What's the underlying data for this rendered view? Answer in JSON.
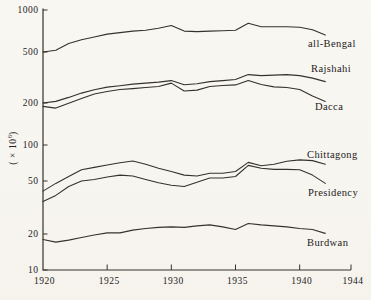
{
  "page": {
    "background": "#f8f6f1",
    "ink": "#35322c",
    "text_color": "#24211c"
  },
  "y_axis_title": {
    "base": "( × 10",
    "exponent": "6",
    "close": ")"
  },
  "chart_data": {
    "type": "line",
    "title": "",
    "xlabel": "",
    "ylabel": "( × 10⁶)",
    "y_scale": "log",
    "grid": false,
    "legend_position": "inline-right",
    "ylim": [
      10,
      1000
    ],
    "xlim": [
      1920,
      1944
    ],
    "y_ticks": [
      1000,
      500,
      200,
      100,
      50,
      20,
      10
    ],
    "x_ticks": [
      1920,
      1925,
      1930,
      1935,
      1940,
      1944
    ],
    "x": [
      1920,
      1921,
      1922,
      1923,
      1924,
      1925,
      1926,
      1927,
      1928,
      1929,
      1930,
      1931,
      1932,
      1933,
      1934,
      1935,
      1936,
      1937,
      1938,
      1939,
      1940,
      1941,
      1942
    ],
    "series": [
      {
        "name": "all-Bengal",
        "values": [
          500,
          515,
          575,
          613,
          640,
          672,
          689,
          706,
          717,
          741,
          774,
          706,
          700,
          706,
          711,
          717,
          803,
          758,
          758,
          758,
          752,
          723,
          661
        ],
        "label_pos": [
          308,
          47
        ]
      },
      {
        "name": "Rajshahi",
        "values": [
          200,
          206,
          221,
          239,
          254,
          266,
          273,
          281,
          286,
          291,
          299,
          278,
          283,
          294,
          299,
          305,
          333,
          327,
          330,
          333,
          327,
          313,
          294
        ],
        "label_pos": [
          311,
          72
        ]
      },
      {
        "name": "Dacca",
        "values": [
          189,
          184,
          199,
          217,
          235,
          246,
          255,
          259,
          264,
          269,
          286,
          248,
          252,
          269,
          274,
          277,
          300,
          279,
          267,
          264,
          255,
          227,
          206
        ],
        "label_pos": [
          315,
          110
        ]
      },
      {
        "name": "Chittagong",
        "values": [
          42,
          48,
          54.5,
          62,
          65,
          68,
          71,
          73.5,
          69,
          64,
          60,
          56,
          55,
          58,
          58,
          60,
          71.5,
          67,
          69,
          73,
          75,
          74,
          69
        ],
        "label_pos": [
          307,
          158
        ]
      },
      {
        "name": "Presidency",
        "values": [
          35,
          39,
          45.5,
          50,
          51.5,
          54,
          56,
          55,
          51.5,
          48.5,
          46.5,
          45.5,
          49,
          53,
          53,
          54.5,
          67.5,
          64,
          62.5,
          62.5,
          62,
          56,
          48
        ],
        "label_pos": [
          308,
          196
        ]
      },
      {
        "name": "Burdwan",
        "values": [
          18,
          17.1,
          17.8,
          18.7,
          19.6,
          20.4,
          20.4,
          21.4,
          22,
          22.4,
          22.6,
          22.4,
          23,
          23.4,
          22.6,
          21.6,
          24,
          23.4,
          23,
          22.6,
          22,
          21.6,
          20.2
        ],
        "label_pos": [
          307,
          246
        ]
      }
    ]
  }
}
